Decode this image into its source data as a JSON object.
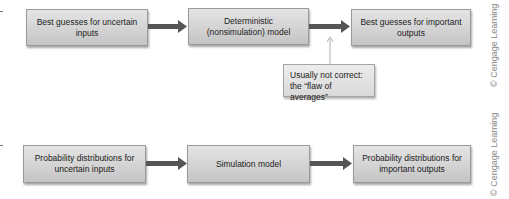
{
  "diagram": {
    "top_row": {
      "boxes": [
        {
          "id": "best-guesses-inputs",
          "label": "Best guesses for uncertain inputs"
        },
        {
          "id": "deterministic-model",
          "label": "Deterministic (nonsimulation) model"
        },
        {
          "id": "best-guesses-outputs",
          "label": "Best guesses for important outputs"
        }
      ],
      "annotation": {
        "label": "Usually not correct: the “flaw of averages”"
      }
    },
    "bottom_row": {
      "boxes": [
        {
          "id": "probability-distributions-inputs",
          "label": "Probability distributions for uncertain inputs"
        },
        {
          "id": "simulation-model",
          "label": "Simulation model"
        },
        {
          "id": "probability-distributions-outputs",
          "label": "Probability distributions for important outputs"
        }
      ]
    },
    "credits": [
      "© Cengage Learning",
      "© Cengage Learning"
    ],
    "colors": {
      "box_fill": "#d3d3d3",
      "box_border": "#9a9a9a",
      "arrow": "#555555",
      "credit_text": "#8a8a8a"
    }
  }
}
